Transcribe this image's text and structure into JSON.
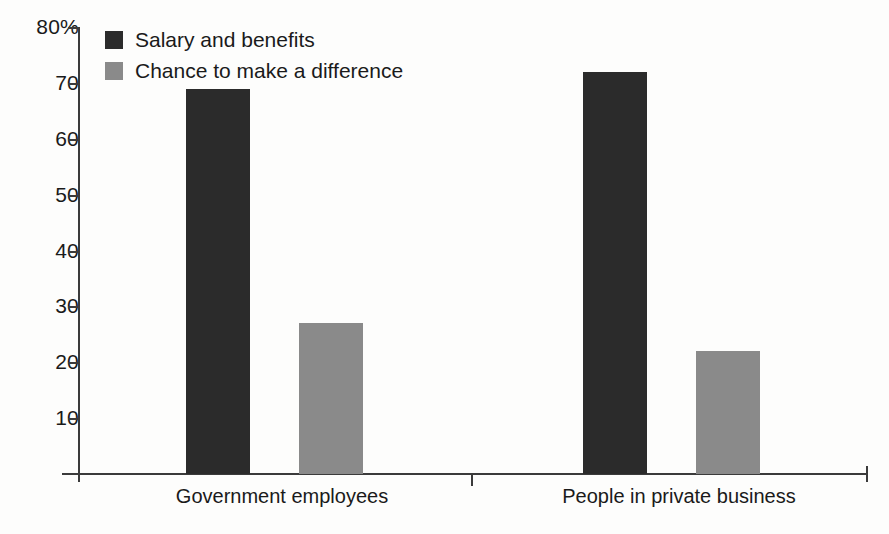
{
  "chart_data": {
    "type": "bar",
    "title": "",
    "subtitle": "",
    "xlabel": "",
    "ylabel": "",
    "categories": [
      "Government employees",
      "People in private business"
    ],
    "series": [
      {
        "name": "Salary and benefits",
        "color": "#2b2b2b",
        "values": [
          69,
          72
        ]
      },
      {
        "name": "Chance to make a difference",
        "color": "#8a8a8a",
        "values": [
          27,
          22
        ]
      }
    ],
    "ylim": [
      0,
      80
    ],
    "y_ticks": [
      {
        "value": 80,
        "label": "80%"
      },
      {
        "value": 70,
        "label": "70"
      },
      {
        "value": 60,
        "label": "60"
      },
      {
        "value": 50,
        "label": "50"
      },
      {
        "value": 40,
        "label": "40"
      },
      {
        "value": 30,
        "label": "30"
      },
      {
        "value": 20,
        "label": "20"
      },
      {
        "value": 10,
        "label": "10"
      }
    ],
    "grid": false,
    "legend_position": "top-left",
    "axis_color": "#3b3b3b",
    "background_color": "#fdfdfc"
  },
  "legend": {
    "items": [
      {
        "label": "Salary and benefits",
        "color": "#2b2b2b"
      },
      {
        "label": "Chance to make a difference",
        "color": "#8a8a8a"
      }
    ]
  },
  "axis": {
    "y_labels": [
      "80%",
      "70",
      "60",
      "50",
      "40",
      "30",
      "20",
      "10"
    ],
    "x_labels": [
      "Government employees",
      "People in private business"
    ]
  }
}
